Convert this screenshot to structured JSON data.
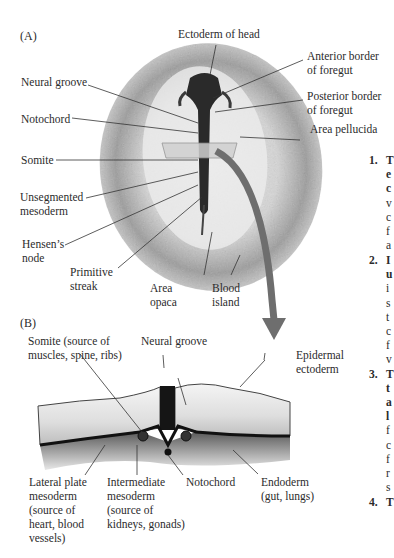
{
  "panels": {
    "a": "(A)",
    "b": "(B)"
  },
  "panel_a_labels": {
    "ectoderm_head": "Ectoderm of head",
    "anterior_foregut_1": "Anterior border",
    "anterior_foregut_2": "of foregut",
    "posterior_foregut_1": "Posterior border",
    "posterior_foregut_2": "of foregut",
    "area_pellucida": "Area pellucida",
    "neural_groove": "Neural groove",
    "notochord": "Notochord",
    "somite": "Somite",
    "unsegmented_1": "Unsegmented",
    "unsegmented_2": "mesoderm",
    "hensens_1": "Hensen’s",
    "hensens_2": "node",
    "primitive_1": "Primitive",
    "primitive_2": "streak",
    "area_opaca_1": "Area",
    "area_opaca_2": "opaca",
    "blood_island_1": "Blood",
    "blood_island_2": "island"
  },
  "panel_b_labels": {
    "somite_1": "Somite (source of",
    "somite_2": "muscles, spine, ribs)",
    "neural_groove": "Neural groove",
    "epidermal_1": "Epidermal",
    "epidermal_2": "ectoderm",
    "lateral_1": "Lateral plate",
    "lateral_2": "mesoderm",
    "lateral_3": "(source of",
    "lateral_4": "heart, blood",
    "lateral_5": "vessels)",
    "intermediate_1": "Intermediate",
    "intermediate_2": "mesoderm",
    "intermediate_3": "(source of",
    "intermediate_4": "kidneys, gonads)",
    "notochord": "Notochord",
    "endoderm_1": "Endoderm",
    "endoderm_2": "(gut, lungs)"
  },
  "side_text": {
    "items": [
      {
        "num": "1.",
        "lines": [
          "T",
          "e",
          "c",
          "v",
          "c",
          "f",
          "a"
        ]
      },
      {
        "num": "2.",
        "lines": [
          "I",
          "u",
          "i",
          "s",
          "t",
          "c",
          "f",
          "v"
        ]
      },
      {
        "num": "3.",
        "lines": [
          "T",
          "t",
          "a",
          "l",
          "f",
          "c",
          "f",
          "r",
          "s"
        ]
      },
      {
        "num": "4.",
        "lines": [
          "T"
        ]
      }
    ]
  },
  "colors": {
    "arrow": "#6e6e6e",
    "tissue": "#e6e6e6",
    "dark": "#1a1a1a"
  }
}
